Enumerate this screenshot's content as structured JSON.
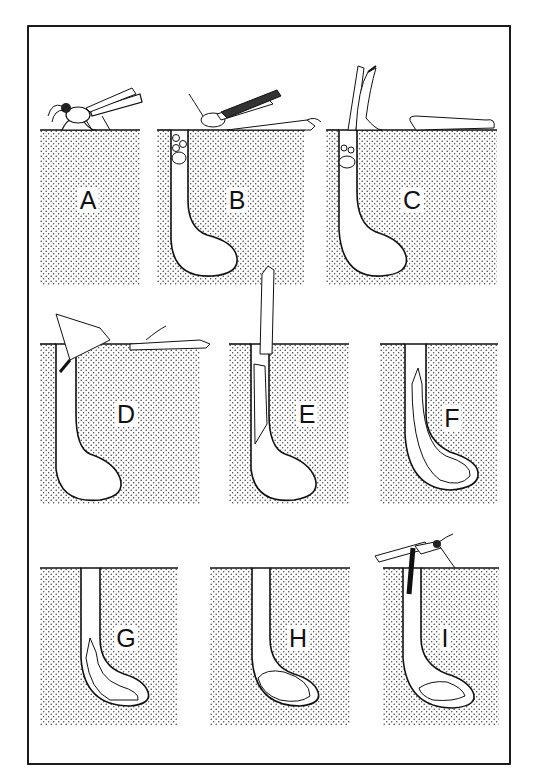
{
  "figure": {
    "colors": {
      "ink": "#111111",
      "soil_dot": "#3a3a3a",
      "background": "#ffffff"
    }
  },
  "panels": [
    {
      "label": "A",
      "stage": "wasp digging at surface",
      "burrow": false
    },
    {
      "label": "B",
      "stage": "burrow dug, wasp bringing prey, entrance plugged with pebbles",
      "burrow": true
    },
    {
      "label": "C",
      "stage": "wasp removing plug, prey lying on surface",
      "burrow": true
    },
    {
      "label": "D",
      "stage": "wasp entering burrow dragging prey",
      "burrow": true
    },
    {
      "label": "E",
      "stage": "prey being drawn down the shaft",
      "burrow": true
    },
    {
      "label": "F",
      "stage": "prey deposited in chamber",
      "burrow": true
    },
    {
      "label": "G",
      "stage": "larva feeding on prey in chamber",
      "burrow": true
    },
    {
      "label": "H",
      "stage": "prey consumed in chamber",
      "burrow": true
    },
    {
      "label": "I",
      "stage": "adult emerging from burrow, cocoon remains",
      "burrow": true
    }
  ]
}
